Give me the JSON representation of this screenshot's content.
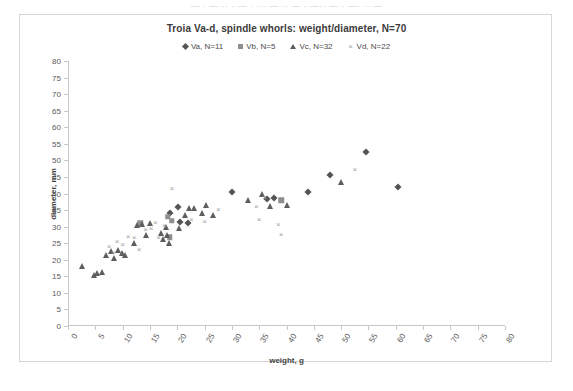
{
  "page": {
    "scan_sliver_text": "— · — ·· · — · ··· — ·· — · —·· — · —· ·· —"
  },
  "chart_data": {
    "type": "scatter",
    "title": "Troia Va-d, spindle whorls: weight/diameter, N=70",
    "xlabel": "weight, g",
    "ylabel": "diameter, mm",
    "xlim": [
      0,
      80
    ],
    "ylim": [
      0,
      80
    ],
    "xticks": [
      0,
      5,
      10,
      15,
      20,
      25,
      30,
      35,
      40,
      45,
      50,
      55,
      60,
      65,
      70,
      75,
      80
    ],
    "yticks": [
      0,
      5,
      10,
      15,
      20,
      25,
      30,
      35,
      40,
      45,
      50,
      55,
      60,
      65,
      70,
      75,
      80
    ],
    "grid": false,
    "legend_position": "top-center",
    "series": [
      {
        "name": "Va, N=11",
        "marker": "diamond",
        "color": "#545454",
        "points": [
          [
            18.7,
            34.0
          ],
          [
            20.2,
            36.0
          ],
          [
            20.5,
            31.3
          ],
          [
            22.0,
            31.0
          ],
          [
            30.0,
            40.5
          ],
          [
            36.5,
            38.2
          ],
          [
            37.8,
            38.5
          ],
          [
            44.0,
            40.5
          ],
          [
            48.0,
            45.5
          ],
          [
            54.5,
            52.5
          ],
          [
            60.5,
            42.0
          ]
        ]
      },
      {
        "name": "Vb, N=5",
        "marker": "square",
        "color": "#8e8e8e",
        "points": [
          [
            13.2,
            31.0
          ],
          [
            18.3,
            33.0
          ],
          [
            19.0,
            31.8
          ],
          [
            18.6,
            26.8
          ],
          [
            39.0,
            38.0
          ]
        ]
      },
      {
        "name": "Vc, N=32",
        "marker": "triangle",
        "color": "#5e5e5e",
        "points": [
          [
            2.6,
            18.0
          ],
          [
            4.7,
            15.5
          ],
          [
            5.3,
            16.0
          ],
          [
            6.2,
            16.2
          ],
          [
            7.0,
            21.5
          ],
          [
            7.8,
            22.5
          ],
          [
            8.5,
            20.5
          ],
          [
            9.2,
            23.0
          ],
          [
            9.8,
            22.0
          ],
          [
            10.4,
            21.5
          ],
          [
            12.0,
            25.0
          ],
          [
            12.6,
            30.5
          ],
          [
            13.6,
            30.8
          ],
          [
            14.3,
            27.5
          ],
          [
            15.0,
            31.2
          ],
          [
            17.0,
            28.0
          ],
          [
            17.4,
            26.3
          ],
          [
            18.0,
            30.0
          ],
          [
            18.2,
            27.5
          ],
          [
            18.4,
            25.0
          ],
          [
            20.3,
            29.5
          ],
          [
            21.5,
            33.5
          ],
          [
            22.2,
            35.5
          ],
          [
            23.0,
            35.5
          ],
          [
            24.5,
            34.0
          ],
          [
            25.3,
            36.5
          ],
          [
            26.5,
            33.5
          ],
          [
            33.0,
            38.0
          ],
          [
            35.5,
            39.8
          ],
          [
            37.0,
            36.3
          ],
          [
            40.0,
            36.5
          ],
          [
            50.0,
            43.5
          ]
        ]
      },
      {
        "name": "Vd, N=22",
        "marker": "x",
        "color": "#9e9e9e",
        "points": [
          [
            7.5,
            24.0
          ],
          [
            8.3,
            22.0
          ],
          [
            9.0,
            25.5
          ],
          [
            10.0,
            24.5
          ],
          [
            11.0,
            27.0
          ],
          [
            12.1,
            26.5
          ],
          [
            13.0,
            23.0
          ],
          [
            14.2,
            29.0
          ],
          [
            15.2,
            29.2
          ],
          [
            16.0,
            31.0
          ],
          [
            16.6,
            26.5
          ],
          [
            17.6,
            30.2
          ],
          [
            19.0,
            41.5
          ],
          [
            22.6,
            32.0
          ],
          [
            25.0,
            31.5
          ],
          [
            27.5,
            35.0
          ],
          [
            34.5,
            36.0
          ],
          [
            35.0,
            32.0
          ],
          [
            36.0,
            38.5
          ],
          [
            38.5,
            30.5
          ],
          [
            39.0,
            27.5
          ],
          [
            52.5,
            47.0
          ]
        ]
      }
    ]
  }
}
